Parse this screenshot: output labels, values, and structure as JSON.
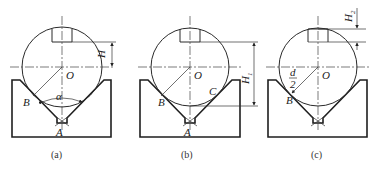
{
  "figure": {
    "panels": [
      {
        "id": "a",
        "caption": "(a)",
        "labels": {
          "center": "O",
          "contact": "B",
          "apex": "A",
          "angle": "α",
          "dimension": "H"
        }
      },
      {
        "id": "b",
        "caption": "(b)",
        "labels": {
          "center": "O",
          "contact_left": "B",
          "contact_right": "C",
          "apex": "A",
          "dimension": "H",
          "dimension_sub": "1"
        }
      },
      {
        "id": "c",
        "caption": "(c)",
        "labels": {
          "center": "O",
          "contact": "B",
          "radius_num": "d",
          "radius_den": "2",
          "dimension": "H",
          "dimension_sub": "2"
        }
      }
    ],
    "colors": {
      "line": "#2a2a2a",
      "background": "#ffffff"
    }
  }
}
